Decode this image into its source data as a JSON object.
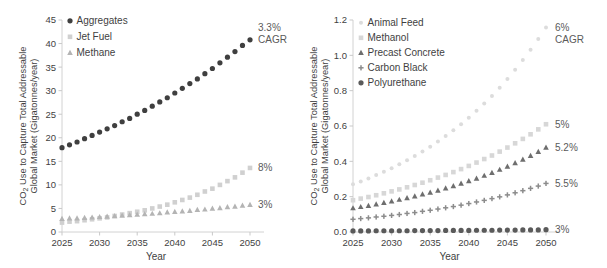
{
  "figure": {
    "background": "#ffffff",
    "panels": [
      "left",
      "right"
    ]
  },
  "chart_data": [
    {
      "panel": "left",
      "type": "scatter",
      "title": "",
      "xlabel": "Year",
      "ylabel": "CO2 Use to Capture Total Addressable Global Market (Gigatonnes/year)",
      "ylabel_line1": "CO",
      "ylabel_sub": "2",
      "ylabel_line1b": " Use to Capture Total Addressable",
      "ylabel_line2": "Global Market (Gigatonnes/year)",
      "xlim": [
        2025,
        2050
      ],
      "ylim": [
        0,
        45
      ],
      "xticks": [
        2025,
        2030,
        2035,
        2040,
        2045,
        2050
      ],
      "yticks": [
        0,
        5,
        10,
        15,
        20,
        25,
        30,
        35,
        40,
        45
      ],
      "grid": false,
      "legend_position": "top-left",
      "x": [
        2025,
        2026,
        2027,
        2028,
        2029,
        2030,
        2031,
        2032,
        2033,
        2034,
        2035,
        2036,
        2037,
        2038,
        2039,
        2040,
        2041,
        2042,
        2043,
        2044,
        2045,
        2046,
        2047,
        2048,
        2049,
        2050
      ],
      "series": [
        {
          "name": "Aggregates",
          "marker": "circle",
          "color": "#3f3f3f",
          "cagr": "3.3%",
          "cagr_suffix": "CAGR",
          "values": [
            17.9,
            18.5,
            19.1,
            19.8,
            20.5,
            21.2,
            21.9,
            22.6,
            23.4,
            24.1,
            25.0,
            25.8,
            26.7,
            27.6,
            28.5,
            29.5,
            30.5,
            31.5,
            32.5,
            33.6,
            34.7,
            35.9,
            37.1,
            38.3,
            39.6,
            40.8
          ]
        },
        {
          "name": "Jet Fuel",
          "marker": "square",
          "color": "#d0d0d0",
          "cagr": "8%",
          "values": [
            2.0,
            2.2,
            2.3,
            2.5,
            2.7,
            2.9,
            3.1,
            3.4,
            3.7,
            4.0,
            4.3,
            4.6,
            5.0,
            5.4,
            5.8,
            6.3,
            6.8,
            7.3,
            7.9,
            8.6,
            9.2,
            10.0,
            10.8,
            11.6,
            12.6,
            13.6
          ]
        },
        {
          "name": "Methane",
          "marker": "triangle",
          "color": "#b4b4b4",
          "cagr": "3%",
          "values": [
            2.8,
            2.9,
            2.9,
            3.0,
            3.1,
            3.2,
            3.3,
            3.4,
            3.5,
            3.6,
            3.7,
            3.8,
            3.9,
            4.0,
            4.2,
            4.3,
            4.4,
            4.5,
            4.7,
            4.8,
            5.0,
            5.1,
            5.3,
            5.4,
            5.6,
            5.8
          ]
        }
      ]
    },
    {
      "panel": "right",
      "type": "scatter",
      "title": "",
      "xlabel": "Year",
      "ylabel": "CO2 Use to Capture Total Addressable Global Market (Gigatonnes/year)",
      "ylabel_line1": "CO",
      "ylabel_sub": "2",
      "ylabel_line1b": " Use to Capture Total Addressable",
      "ylabel_line2": "Global Market (Gigatonnes/year)",
      "xlim": [
        2025,
        2050
      ],
      "ylim": [
        0.0,
        1.2
      ],
      "xticks": [
        2025,
        2030,
        2035,
        2040,
        2045,
        2050
      ],
      "yticks": [
        "0.0",
        "0.2",
        "0.4",
        "0.6",
        "0.8",
        "1.0",
        "1.2"
      ],
      "ytick_values": [
        0.0,
        0.2,
        0.4,
        0.6,
        0.8,
        1.0,
        1.2
      ],
      "grid": false,
      "legend_position": "top-left",
      "x": [
        2025,
        2026,
        2027,
        2028,
        2029,
        2030,
        2031,
        2032,
        2033,
        2034,
        2035,
        2036,
        2037,
        2038,
        2039,
        2040,
        2041,
        2042,
        2043,
        2044,
        2045,
        2046,
        2047,
        2048,
        2049,
        2050
      ],
      "series": [
        {
          "name": "Animal Feed",
          "marker": "circle-small",
          "color": "#dcdcdc",
          "cagr": "6%",
          "cagr_suffix": "CAGR",
          "values": [
            0.27,
            0.286,
            0.303,
            0.322,
            0.341,
            0.361,
            0.383,
            0.406,
            0.43,
            0.456,
            0.483,
            0.512,
            0.543,
            0.576,
            0.61,
            0.647,
            0.686,
            0.727,
            0.77,
            0.817,
            0.866,
            0.918,
            0.973,
            1.031,
            1.093,
            1.158
          ]
        },
        {
          "name": "Methanol",
          "marker": "square",
          "color": "#d7d7d7",
          "cagr": "5%",
          "values": [
            0.18,
            0.189,
            0.198,
            0.208,
            0.219,
            0.23,
            0.241,
            0.253,
            0.266,
            0.279,
            0.293,
            0.308,
            0.323,
            0.339,
            0.356,
            0.374,
            0.393,
            0.413,
            0.433,
            0.455,
            0.478,
            0.502,
            0.527,
            0.553,
            0.581,
            0.61
          ]
        },
        {
          "name": "Precast Concrete",
          "marker": "triangle",
          "color": "#6e6e6e",
          "cagr": "5.2%",
          "values": [
            0.135,
            0.142,
            0.149,
            0.157,
            0.165,
            0.174,
            0.183,
            0.192,
            0.202,
            0.213,
            0.224,
            0.235,
            0.247,
            0.26,
            0.274,
            0.288,
            0.303,
            0.319,
            0.335,
            0.353,
            0.371,
            0.39,
            0.41,
            0.432,
            0.454,
            0.478
          ]
        },
        {
          "name": "Carbon Black",
          "marker": "plus",
          "color": "#8c8c8c",
          "cagr": "5.5%",
          "values": [
            0.072,
            0.076,
            0.08,
            0.085,
            0.089,
            0.094,
            0.099,
            0.105,
            0.11,
            0.117,
            0.123,
            0.13,
            0.137,
            0.144,
            0.152,
            0.161,
            0.17,
            0.179,
            0.189,
            0.199,
            0.21,
            0.222,
            0.234,
            0.247,
            0.26,
            0.275
          ]
        },
        {
          "name": "Polyurethane",
          "marker": "circle",
          "color": "#5a5a5a",
          "cagr": "3%",
          "values": [
            0.006,
            0.006,
            0.006,
            0.007,
            0.007,
            0.007,
            0.007,
            0.007,
            0.008,
            0.008,
            0.008,
            0.008,
            0.009,
            0.009,
            0.009,
            0.009,
            0.01,
            0.01,
            0.01,
            0.011,
            0.011,
            0.011,
            0.012,
            0.012,
            0.012,
            0.013
          ]
        }
      ]
    }
  ]
}
